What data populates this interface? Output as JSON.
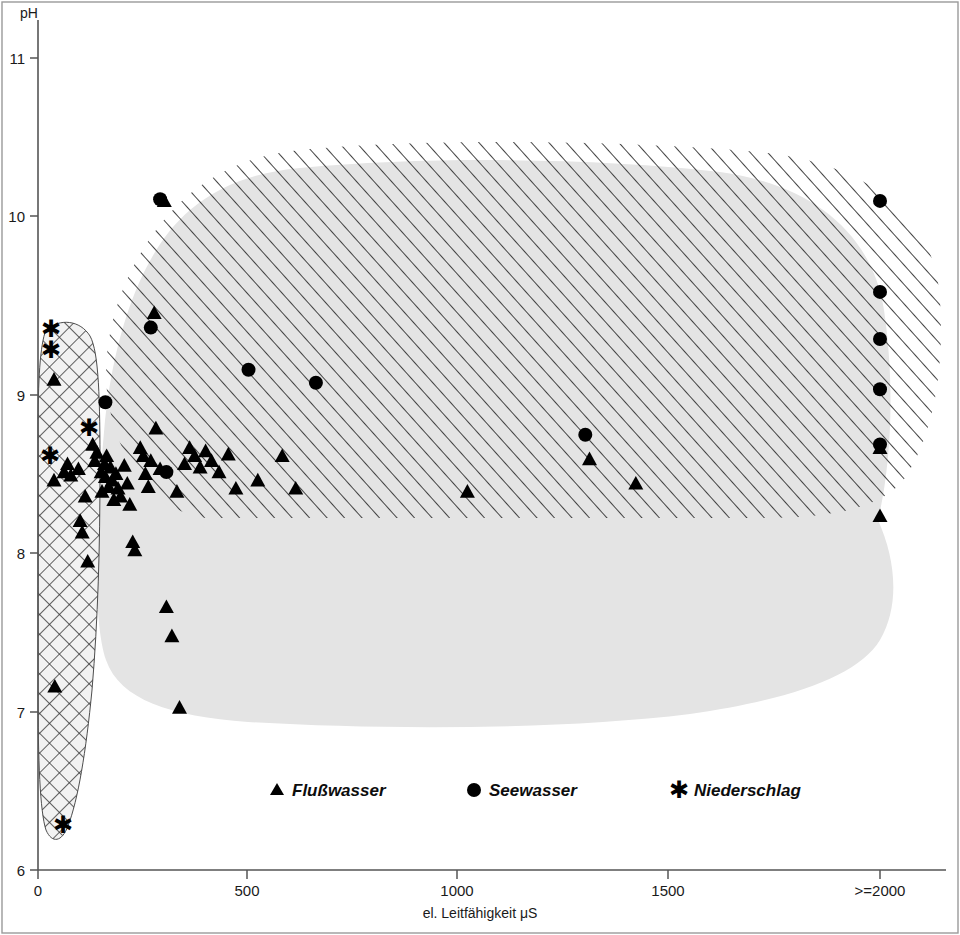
{
  "chart_data": {
    "type": "scatter",
    "title": "",
    "xlabel": "el. Leitfähigkeit  μS",
    "ylabel": "pH",
    "xlim": [
      0,
      2150
    ],
    "ylim": [
      6,
      11.35
    ],
    "grid": false,
    "legend_position": "bottom-center",
    "x_ticks": [
      {
        "value": 0,
        "label": "0"
      },
      {
        "value": 500,
        "label": "500"
      },
      {
        "value": 1000,
        "label": "1000"
      },
      {
        "value": 1500,
        "label": "1500"
      },
      {
        "value": 2000,
        "label": ">=2000"
      }
    ],
    "y_ticks": [
      {
        "value": 6,
        "label": "6"
      },
      {
        "value": 7,
        "label": "7"
      },
      {
        "value": 8,
        "label": "8"
      },
      {
        "value": 9,
        "label": "9"
      },
      {
        "value": 10,
        "label": "10"
      },
      {
        "value": 11,
        "label": "11"
      }
    ],
    "legend": [
      {
        "symbol": "triangle",
        "label": "Flußwasser"
      },
      {
        "symbol": "circle",
        "label": "Seewasser"
      },
      {
        "symbol": "asterisk",
        "label": "Niederschlag"
      }
    ],
    "regions": [
      {
        "name": "niederschlag-envelope",
        "fill": "crosshatch",
        "description": "narrow cross-hatched band for precipitation samples at low conductivity"
      },
      {
        "name": "flusswasser-envelope",
        "fill": "solid-gray",
        "description": "large light-gray filled envelope for river water samples"
      },
      {
        "name": "seewasser-envelope",
        "fill": "diagonal-hatch",
        "description": "diagonally hatched envelope for lake water samples"
      }
    ],
    "series": [
      {
        "name": "Flußwasser",
        "symbol": "triangle",
        "points": [
          [
            38,
            9.02
          ],
          [
            38,
            8.4
          ],
          [
            40,
            7.13
          ],
          [
            62,
            8.45
          ],
          [
            70,
            8.5
          ],
          [
            78,
            8.43
          ],
          [
            96,
            8.47
          ],
          [
            100,
            8.15
          ],
          [
            105,
            8.08
          ],
          [
            112,
            8.3
          ],
          [
            118,
            7.9
          ],
          [
            130,
            8.62
          ],
          [
            135,
            8.52
          ],
          [
            140,
            8.57
          ],
          [
            150,
            8.45
          ],
          [
            152,
            8.33
          ],
          [
            158,
            8.5
          ],
          [
            160,
            8.42
          ],
          [
            163,
            8.55
          ],
          [
            168,
            8.36
          ],
          [
            172,
            8.48
          ],
          [
            176,
            8.4
          ],
          [
            180,
            8.28
          ],
          [
            185,
            8.44
          ],
          [
            190,
            8.35
          ],
          [
            196,
            8.3
          ],
          [
            205,
            8.49
          ],
          [
            212,
            8.38
          ],
          [
            218,
            8.25
          ],
          [
            225,
            8.02
          ],
          [
            230,
            7.97
          ],
          [
            243,
            8.6
          ],
          [
            250,
            8.55
          ],
          [
            255,
            8.44
          ],
          [
            262,
            8.36
          ],
          [
            268,
            8.52
          ],
          [
            276,
            9.43
          ],
          [
            280,
            8.72
          ],
          [
            290,
            8.47
          ],
          [
            300,
            10.12
          ],
          [
            305,
            7.62
          ],
          [
            318,
            7.44
          ],
          [
            330,
            8.33
          ],
          [
            336,
            7.0
          ],
          [
            348,
            8.5
          ],
          [
            360,
            8.6
          ],
          [
            372,
            8.55
          ],
          [
            385,
            8.48
          ],
          [
            398,
            8.58
          ],
          [
            412,
            8.52
          ],
          [
            430,
            8.45
          ],
          [
            452,
            8.56
          ],
          [
            470,
            8.35
          ],
          [
            522,
            8.4
          ],
          [
            580,
            8.55
          ],
          [
            612,
            8.35
          ],
          [
            1020,
            8.33
          ],
          [
            1310,
            8.53
          ],
          [
            1420,
            8.38
          ],
          [
            2000,
            8.6
          ],
          [
            2000,
            8.18
          ]
        ]
      },
      {
        "name": "Seewasser",
        "symbol": "circle",
        "points": [
          [
            160,
            8.88
          ],
          [
            268,
            9.34
          ],
          [
            290,
            10.13
          ],
          [
            305,
            8.45
          ],
          [
            500,
            9.08
          ],
          [
            660,
            9.0
          ],
          [
            1300,
            8.68
          ],
          [
            2000,
            10.12
          ],
          [
            2000,
            9.56
          ],
          [
            2000,
            9.27
          ],
          [
            2000,
            8.96
          ],
          [
            2000,
            8.62
          ]
        ]
      },
      {
        "name": "Niederschlag",
        "symbol": "asterisk",
        "points": [
          [
            30,
            9.33
          ],
          [
            30,
            9.2
          ],
          [
            28,
            8.55
          ],
          [
            120,
            8.72
          ],
          [
            60,
            6.28
          ]
        ]
      }
    ]
  },
  "axes": {
    "y_axis_caption": "pH",
    "x_axis_caption": "el. Leitfähigkeit  μS"
  },
  "colors": {
    "fill_gray": "#e2e2e2",
    "hatch_line": "#3a3a3a",
    "marker": "#000000",
    "axis": "#555555",
    "frame": "#9a9a9a"
  },
  "frame": {
    "visible": true,
    "style": "thin outer border"
  }
}
